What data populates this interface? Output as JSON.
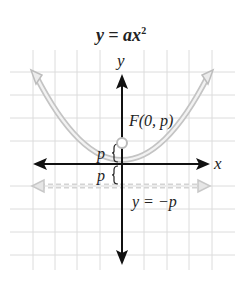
{
  "title": {
    "text": "y = ax",
    "exponent": "2"
  },
  "axes": {
    "x_label": "x",
    "y_label": "y"
  },
  "annotations": {
    "focus_label": "F(0, p)",
    "directrix_label": "y = −p",
    "upper_distance_label": "p",
    "lower_distance_label": "p"
  },
  "colors": {
    "grid": "#d9d9d9",
    "axis": "#111111",
    "curve": "#c8c8c8",
    "directrix": "#d0d0d0",
    "text": "#222222"
  }
}
